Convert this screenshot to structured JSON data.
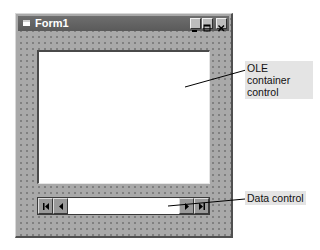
{
  "window": {
    "title": "Form1",
    "icon": "form-icon",
    "buttons": {
      "minimize": "minimize-icon",
      "maximize": "maximize-icon",
      "close": "close-icon"
    }
  },
  "controls": {
    "ole_container": {
      "type": "OLE container"
    },
    "data_control": {
      "caption": "",
      "buttons": [
        "first-record-icon",
        "previous-record-icon",
        "next-record-icon",
        "last-record-icon"
      ]
    }
  },
  "callouts": {
    "ole_label": "OLE container control",
    "data_label": "Data control"
  },
  "colors": {
    "form_bg": "#a9a9a9",
    "titlebar": "#606060",
    "callout_bg": "#e4e4e4"
  }
}
